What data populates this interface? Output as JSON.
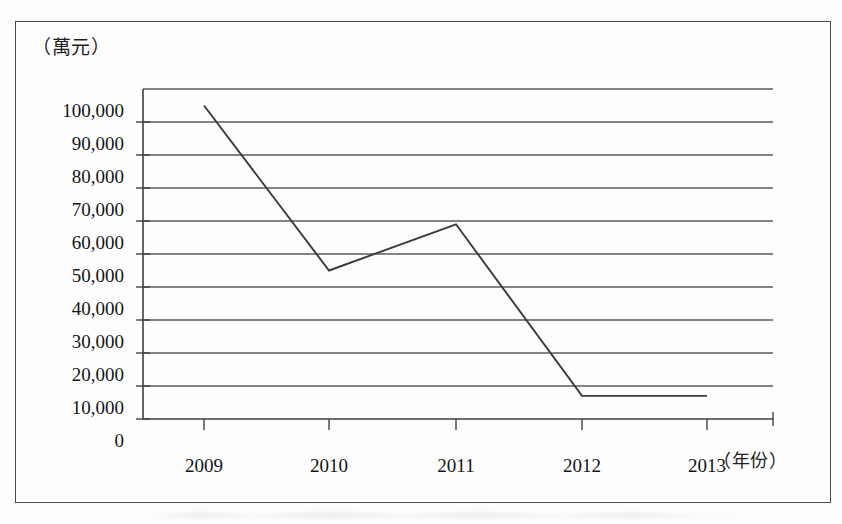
{
  "chart_data": {
    "type": "line",
    "title": "",
    "subtitle": "",
    "xlabel": "（年份）",
    "ylabel": "（萬元）",
    "categories": [
      "2009",
      "2010",
      "2011",
      "2012",
      "2013"
    ],
    "series": [
      {
        "name": "金額",
        "values": [
          95000,
          45000,
          59000,
          7000,
          7000
        ]
      }
    ],
    "x_tick_labels": [
      "2009",
      "2010",
      "2011",
      "2012",
      "2013"
    ],
    "y_tick_labels": [
      "100,000",
      "90,000",
      "80,000",
      "70,000",
      "60,000",
      "50,000",
      "40,000",
      "30,000",
      "20,000",
      "10,000",
      "0"
    ],
    "y_tick_values": [
      100000,
      90000,
      80000,
      70000,
      60000,
      50000,
      40000,
      30000,
      20000,
      10000,
      0
    ],
    "ylim": [
      0,
      100000
    ],
    "y_interval": 10000,
    "grid": "horizontal",
    "legend": "none",
    "line_color": "#3a3a3a",
    "grid_color": "#595959",
    "axis_color": "#3f3f3f",
    "background_color": "#fefefe",
    "markers": "none"
  },
  "frame": {
    "border_color": "#4a4a4a"
  }
}
